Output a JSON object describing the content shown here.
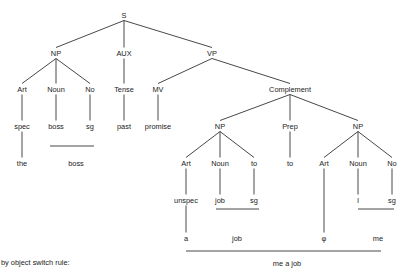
{
  "diagram": {
    "type": "syntax-tree",
    "top_fragment": "",
    "caption": "by object switch rule:",
    "nodes": [
      {
        "id": "S",
        "label": "S",
        "x": 124,
        "y": 15
      },
      {
        "id": "NP1",
        "label": "NP",
        "x": 56,
        "y": 53
      },
      {
        "id": "AUX",
        "label": "AUX",
        "x": 124,
        "y": 53
      },
      {
        "id": "VP",
        "label": "VP",
        "x": 212,
        "y": 53
      },
      {
        "id": "Art1",
        "label": "Art",
        "x": 22,
        "y": 89
      },
      {
        "id": "Noun1",
        "label": "Noun",
        "x": 56,
        "y": 89
      },
      {
        "id": "No1",
        "label": "No",
        "x": 90,
        "y": 89
      },
      {
        "id": "Tense",
        "label": "Tense",
        "x": 124,
        "y": 89
      },
      {
        "id": "MV",
        "label": "MV",
        "x": 158,
        "y": 89
      },
      {
        "id": "Complement",
        "label": "Complement",
        "x": 290,
        "y": 89
      },
      {
        "id": "spec",
        "label": "spec",
        "x": 22,
        "y": 126
      },
      {
        "id": "boss1",
        "label": "boss",
        "x": 56,
        "y": 126
      },
      {
        "id": "sg1",
        "label": "sg",
        "x": 90,
        "y": 126
      },
      {
        "id": "past",
        "label": "past",
        "x": 124,
        "y": 126
      },
      {
        "id": "promise",
        "label": "promise",
        "x": 158,
        "y": 126
      },
      {
        "id": "NP2",
        "label": "NP",
        "x": 220,
        "y": 126
      },
      {
        "id": "Prep",
        "label": "Prep",
        "x": 290,
        "y": 126
      },
      {
        "id": "NP3",
        "label": "NP",
        "x": 358,
        "y": 126
      },
      {
        "id": "the",
        "label": "the",
        "x": 22,
        "y": 163
      },
      {
        "id": "boss2",
        "label": "boss",
        "x": 76,
        "y": 163
      },
      {
        "id": "Art2",
        "label": "Art",
        "x": 186,
        "y": 163
      },
      {
        "id": "Noun2",
        "label": "Noun",
        "x": 220,
        "y": 163
      },
      {
        "id": "to1",
        "label": "to",
        "x": 254,
        "y": 163
      },
      {
        "id": "to2",
        "label": "to",
        "x": 290,
        "y": 163
      },
      {
        "id": "Art3",
        "label": "Art",
        "x": 324,
        "y": 163
      },
      {
        "id": "Noun3",
        "label": "Noun",
        "x": 358,
        "y": 163
      },
      {
        "id": "No3",
        "label": "No",
        "x": 392,
        "y": 163
      },
      {
        "id": "unspec",
        "label": "unspec",
        "x": 186,
        "y": 200
      },
      {
        "id": "job1",
        "label": "job",
        "x": 220,
        "y": 200
      },
      {
        "id": "sg2",
        "label": "sg",
        "x": 254,
        "y": 200
      },
      {
        "id": "I",
        "label": "I",
        "x": 358,
        "y": 200
      },
      {
        "id": "sg3",
        "label": "sg",
        "x": 392,
        "y": 200
      },
      {
        "id": "a",
        "label": "a",
        "x": 186,
        "y": 238
      },
      {
        "id": "job2",
        "label": "job",
        "x": 237,
        "y": 238
      },
      {
        "id": "phi",
        "label": "φ",
        "x": 324,
        "y": 238
      },
      {
        "id": "me",
        "label": "me",
        "x": 378,
        "y": 238
      },
      {
        "id": "mejob",
        "label": "me a job",
        "x": 287,
        "y": 263
      }
    ],
    "edges": [
      [
        "S",
        "NP1"
      ],
      [
        "S",
        "AUX"
      ],
      [
        "S",
        "VP"
      ],
      [
        "NP1",
        "Art1"
      ],
      [
        "NP1",
        "Noun1"
      ],
      [
        "NP1",
        "No1"
      ],
      [
        "AUX",
        "Tense"
      ],
      [
        "VP",
        "MV"
      ],
      [
        "VP",
        "Complement"
      ],
      [
        "Art1",
        "spec"
      ],
      [
        "Noun1",
        "boss1"
      ],
      [
        "No1",
        "sg1"
      ],
      [
        "Tense",
        "past"
      ],
      [
        "MV",
        "promise"
      ],
      [
        "Complement",
        "NP2"
      ],
      [
        "Complement",
        "Prep"
      ],
      [
        "Complement",
        "NP3"
      ],
      [
        "spec",
        "the"
      ],
      [
        "NP2",
        "Art2"
      ],
      [
        "NP2",
        "Noun2"
      ],
      [
        "NP2",
        "to1"
      ],
      [
        "Prep",
        "to2"
      ],
      [
        "NP3",
        "Art3"
      ],
      [
        "NP3",
        "Noun3"
      ],
      [
        "NP3",
        "No3"
      ],
      [
        "Art2",
        "unspec"
      ],
      [
        "Noun2",
        "job1"
      ],
      [
        "to1",
        "sg2"
      ],
      [
        "Noun3",
        "I"
      ],
      [
        "No3",
        "sg3"
      ],
      [
        "unspec",
        "a"
      ],
      [
        "Art3",
        "phi"
      ]
    ],
    "underlines": [
      {
        "x1": 50,
        "x2": 94,
        "y": 146
      },
      {
        "x1": 216,
        "x2": 259,
        "y": 209
      },
      {
        "x1": 358,
        "x2": 394,
        "y": 209
      },
      {
        "x1": 186,
        "x2": 381,
        "y": 251
      }
    ]
  }
}
